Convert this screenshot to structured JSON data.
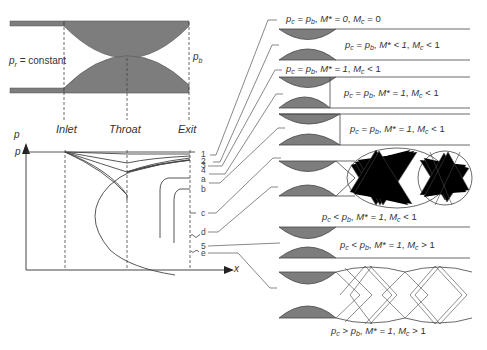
{
  "nozzle": {
    "reservoir_label": "p",
    "reservoir_sub": "r",
    "reservoir_suffix": "= constant",
    "back_label": "p",
    "back_sub": "b"
  },
  "graph": {
    "y_axis_label": "p",
    "y_axis_ref_label": "p",
    "x_axis_label": "x",
    "stations": [
      "Inlet",
      "Throat",
      "Exit"
    ],
    "curve_labels": [
      "1",
      "2",
      "3",
      "4",
      "a",
      "b",
      "c",
      "d",
      "5",
      "e"
    ]
  },
  "conditions": [
    {
      "id": "1",
      "pc": "p",
      "pc_sub": "c",
      "rel": "=",
      "pb": "p",
      "pb_sub": "b",
      "mstar": "M* = 0",
      "mc": "M",
      "mc_sub": "c",
      "mc_rel": "= 0"
    },
    {
      "id": "2",
      "pc": "p",
      "pc_sub": "c",
      "rel": "=",
      "pb": "p",
      "pb_sub": "b",
      "mstar": "M* < 1",
      "mc": "M",
      "mc_sub": "c",
      "mc_rel": "< 1"
    },
    {
      "id": "3",
      "pc": "p",
      "pc_sub": "c",
      "rel": "=",
      "pb": "p",
      "pb_sub": "b",
      "mstar": "M* = 1",
      "mc": "M",
      "mc_sub": "c",
      "mc_rel": "< 1"
    },
    {
      "id": "a",
      "pc": "p",
      "pc_sub": "c",
      "rel": "=",
      "pb": "p",
      "pb_sub": "b",
      "mstar": "M* = 1",
      "mc": "M",
      "mc_sub": "c",
      "mc_rel": "< 1"
    },
    {
      "id": "b",
      "pc": "p",
      "pc_sub": "c",
      "rel": "=",
      "pb": "p",
      "pb_sub": "b",
      "mstar": "M* = 1",
      "mc": "M",
      "mc_sub": "c",
      "mc_rel": "< 1"
    },
    {
      "id": "c-d",
      "pc": "p",
      "pc_sub": "c",
      "rel": "<",
      "pb": "p",
      "pb_sub": "b",
      "mstar": "M* = 1",
      "mc": "M",
      "mc_sub": "c",
      "mc_rel": "< 1"
    },
    {
      "id": "5",
      "pc": "p",
      "pc_sub": "c",
      "rel": "<",
      "pb": "p",
      "pb_sub": "b",
      "mstar": "M* = 1",
      "mc": "M",
      "mc_sub": "c",
      "mc_rel": "> 1"
    },
    {
      "id": "e",
      "pc": "p",
      "pc_sub": "c",
      "rel": ">",
      "pb": "p",
      "pb_sub": "b",
      "mstar": "M* = 1",
      "mc": "M",
      "mc_sub": "c",
      "mc_rel": "> 1"
    }
  ],
  "colors": {
    "fill": "#7d7d7d",
    "line": "#444444",
    "text": "#333333"
  }
}
